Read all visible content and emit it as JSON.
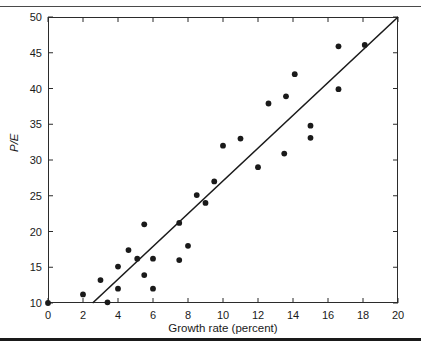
{
  "figure": {
    "name": "pe-growth-scatter",
    "background_color": "#ffffff",
    "frame_color": "#2b2b2b",
    "marker_color": "#1a1a1a",
    "line_color": "#1a1a1a"
  },
  "rules": {
    "top_rule_color": "#4a4a4a",
    "bottom_rule_color": "#1a1a1a"
  },
  "chart_data": {
    "type": "scatter",
    "title": "",
    "subtitle": "",
    "xlabel": "Growth rate (percent)",
    "ylabel": "P/E",
    "xlim": [
      0,
      20
    ],
    "ylim": [
      10,
      50
    ],
    "xticks": [
      0,
      2,
      4,
      6,
      8,
      10,
      12,
      14,
      16,
      18,
      20
    ],
    "yticks": [
      10,
      15,
      20,
      25,
      30,
      35,
      40,
      45,
      50
    ],
    "xticklabels": [
      "0",
      "2",
      "4",
      "6",
      "8",
      "10",
      "12",
      "14",
      "16",
      "18",
      "20"
    ],
    "yticklabels": [
      "10",
      "15",
      "20",
      "25",
      "30",
      "35",
      "40",
      "45",
      "50"
    ],
    "grid": false,
    "legend": null,
    "legend_position": "none",
    "annotations": [],
    "series": [
      {
        "name": "companies",
        "type": "scatter",
        "marker": "filled-circle",
        "marker_size_px": 5,
        "color": "#1a1a1a",
        "points": [
          {
            "x": 0.0,
            "y": 10.0
          },
          {
            "x": 2.0,
            "y": 11.2
          },
          {
            "x": 3.0,
            "y": 13.2
          },
          {
            "x": 3.4,
            "y": 10.1
          },
          {
            "x": 4.0,
            "y": 12.0
          },
          {
            "x": 4.0,
            "y": 15.1
          },
          {
            "x": 4.6,
            "y": 17.4
          },
          {
            "x": 5.1,
            "y": 16.2
          },
          {
            "x": 5.5,
            "y": 13.9
          },
          {
            "x": 5.5,
            "y": 21.0
          },
          {
            "x": 6.0,
            "y": 12.0
          },
          {
            "x": 6.0,
            "y": 16.2
          },
          {
            "x": 7.5,
            "y": 16.0
          },
          {
            "x": 7.5,
            "y": 21.2
          },
          {
            "x": 8.0,
            "y": 18.0
          },
          {
            "x": 8.5,
            "y": 25.1
          },
          {
            "x": 9.0,
            "y": 24.0
          },
          {
            "x": 9.5,
            "y": 27.0
          },
          {
            "x": 10.0,
            "y": 32.0
          },
          {
            "x": 11.0,
            "y": 33.0
          },
          {
            "x": 12.0,
            "y": 29.0
          },
          {
            "x": 12.6,
            "y": 37.9
          },
          {
            "x": 13.5,
            "y": 30.9
          },
          {
            "x": 13.6,
            "y": 38.9
          },
          {
            "x": 14.1,
            "y": 42.0
          },
          {
            "x": 15.0,
            "y": 33.1
          },
          {
            "x": 15.0,
            "y": 34.8
          },
          {
            "x": 16.6,
            "y": 39.9
          },
          {
            "x": 16.6,
            "y": 45.9
          },
          {
            "x": 18.1,
            "y": 46.1
          }
        ]
      },
      {
        "name": "regression-line",
        "type": "line",
        "color": "#1a1a1a",
        "width_px": 1.6,
        "endpoints": [
          {
            "x": 2.55,
            "y": 10.0
          },
          {
            "x": 20.0,
            "y": 50.0
          }
        ],
        "slope": 2.292,
        "intercept": 4.155
      }
    ]
  }
}
